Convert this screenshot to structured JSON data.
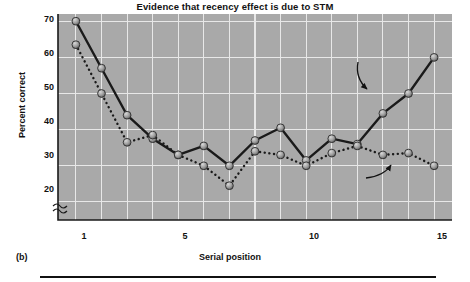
{
  "figure": {
    "panel_caption": "(b)",
    "title": "Evidence that recency effect is due to STM"
  },
  "axes": {
    "ylabel": "Percent correct",
    "xlabel": "Serial position",
    "yticks": [
      70,
      60,
      50,
      40,
      30,
      20
    ],
    "xticks": [
      1,
      5,
      10,
      15
    ],
    "axis_break": "break-symbol"
  },
  "annotations": {
    "no_delay": "No delay",
    "delay": "30-sec delay eliminates\nrecency effect"
  },
  "colors": {
    "plot_background": "#a9a9a9",
    "gridline": "#e8e8e8",
    "line": "#1a1a1a",
    "marker_fill": "#9a9a9a",
    "marker_edge": "#2b2b2b",
    "text": "#111111"
  },
  "chart_data": {
    "type": "line",
    "title": "Evidence that recency effect is due to STM",
    "xlabel": "Serial position",
    "ylabel": "Percent correct",
    "xlim": [
      0.3,
      15.7
    ],
    "ylim": [
      15,
      72
    ],
    "grid": true,
    "legend": "annotated-inline",
    "x": [
      1,
      2,
      3,
      4,
      5,
      6,
      7,
      8,
      9,
      10,
      11,
      12,
      13,
      14,
      15
    ],
    "series": [
      {
        "name": "No delay",
        "style": "solid",
        "values": [
          70,
          57,
          44,
          37.5,
          33,
          35.5,
          30,
          37,
          40.5,
          31.5,
          37.5,
          36,
          44.5,
          50,
          60
        ]
      },
      {
        "name": "30-sec delay eliminates recency effect",
        "style": "dotted",
        "values": [
          63.5,
          50,
          36.5,
          38.5,
          33,
          30,
          24.5,
          34,
          33,
          30,
          33.5,
          35.5,
          33,
          33.5,
          30
        ]
      }
    ]
  }
}
